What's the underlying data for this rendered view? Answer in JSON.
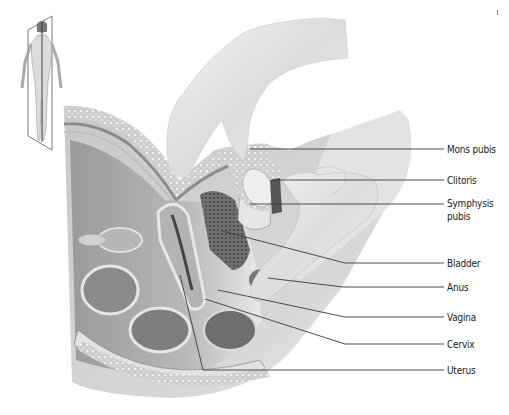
{
  "figure": {
    "orientation_inset": "full-body-figure-with-sagittal-plane",
    "labels": [
      {
        "id": "mons-pubis",
        "text": "Mons pubis",
        "label_y": 149,
        "line": [
          [
            250,
            149
          ],
          [
            444,
            149
          ]
        ]
      },
      {
        "id": "clitoris",
        "text": "Clitoris",
        "label_y": 181,
        "line": [
          [
            272,
            180
          ],
          [
            444,
            180
          ]
        ]
      },
      {
        "id": "symphysis-pubis",
        "text": "Symphysis",
        "text2": "pubis",
        "label_y": 203,
        "line": [
          [
            250,
            204
          ],
          [
            444,
            204
          ]
        ]
      },
      {
        "id": "bladder",
        "text": "Bladder",
        "label_y": 264,
        "line": [
          [
            222,
            231
          ],
          [
            345,
            263
          ],
          [
            444,
            263
          ]
        ]
      },
      {
        "id": "anus",
        "text": "Anus",
        "label_y": 287,
        "line": [
          [
            268,
            278
          ],
          [
            343,
            287
          ],
          [
            444,
            287
          ]
        ]
      },
      {
        "id": "vagina",
        "text": "Vagina",
        "label_y": 318,
        "line": [
          [
            218,
            290
          ],
          [
            345,
            317
          ],
          [
            444,
            317
          ]
        ]
      },
      {
        "id": "cervix",
        "text": "Cervix",
        "label_y": 344,
        "line": [
          [
            205,
            299
          ],
          [
            345,
            344
          ],
          [
            444,
            344
          ]
        ]
      },
      {
        "id": "uterus",
        "text": "Uterus",
        "label_y": 370,
        "line": [
          [
            180,
            275
          ],
          [
            203,
            370
          ],
          [
            444,
            370
          ]
        ]
      }
    ],
    "colors": {
      "line": "#3a3a3a",
      "label": "#1a1a1a",
      "tissue_dark": "#7a7a7a",
      "tissue_mid": "#a8a8a8",
      "tissue_light": "#d8d8d8",
      "hand": "#e6e6e6"
    }
  }
}
